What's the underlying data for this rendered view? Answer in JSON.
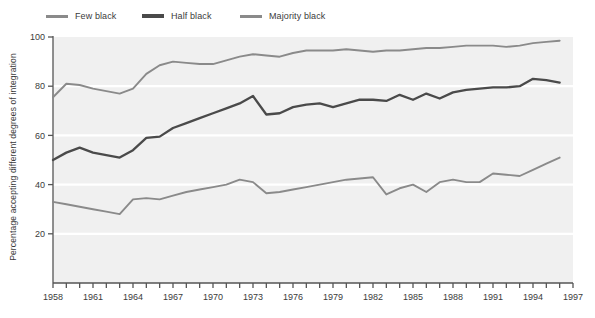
{
  "chart_data": {
    "type": "line",
    "title": "",
    "subtitle": "",
    "xlabel": "",
    "ylabel": "Percentage accepting different degrees of integration",
    "xlim": [
      1958,
      1997
    ],
    "ylim": [
      0,
      100
    ],
    "grid": true,
    "grid_orientation": "horizontal",
    "legend_position": "top-left",
    "ytick_labels": [
      "20",
      "40",
      "60",
      "80",
      "100"
    ],
    "ytick_values": [
      20,
      40,
      60,
      80,
      100
    ],
    "xtick_labels": [
      "1958",
      "1961",
      "1964",
      "1967",
      "1970",
      "1973",
      "1976",
      "1979",
      "1982",
      "1985",
      "1988",
      "1991",
      "1994",
      "1997"
    ],
    "xtick_values": [
      1958,
      1961,
      1964,
      1967,
      1970,
      1973,
      1976,
      1979,
      1982,
      1985,
      1988,
      1991,
      1994,
      1997
    ],
    "x": [
      1958,
      1959,
      1960,
      1961,
      1962,
      1963,
      1964,
      1965,
      1966,
      1967,
      1968,
      1969,
      1970,
      1971,
      1972,
      1973,
      1974,
      1975,
      1976,
      1977,
      1978,
      1979,
      1980,
      1981,
      1982,
      1983,
      1984,
      1985,
      1986,
      1987,
      1988,
      1989,
      1990,
      1991,
      1992,
      1993,
      1994,
      1995,
      1996
    ],
    "series": [
      {
        "name": "Few black",
        "color": "#8a8a8a",
        "values": [
          33,
          32,
          31,
          30,
          29,
          28,
          34,
          34.5,
          34,
          35.5,
          37,
          38,
          39,
          40,
          42,
          41,
          36.5,
          37,
          38,
          39,
          40,
          41,
          42,
          42.5,
          43,
          36,
          38.5,
          40,
          37,
          41,
          42,
          41,
          41,
          44.5,
          44,
          43.5,
          46,
          48.5,
          51
        ]
      },
      {
        "name": "Half black",
        "color": "#4a4a4a",
        "values": [
          50,
          53,
          55,
          53,
          52,
          51,
          54,
          59,
          59.5,
          63,
          65,
          67,
          69,
          71,
          73,
          76,
          68.5,
          69,
          71.5,
          72.5,
          73,
          71.5,
          73,
          74.5,
          74.5,
          74,
          76.5,
          74.5,
          77,
          75,
          77.5,
          78.5,
          79,
          79.5,
          79.5,
          80,
          83,
          82.5,
          81.5
        ]
      },
      {
        "name": "Majority black",
        "color": "#8a8a8a",
        "values": [
          75.5,
          81,
          80.5,
          79,
          78,
          77,
          79,
          85,
          88.5,
          90,
          89.5,
          89,
          89,
          90.5,
          92,
          93,
          92.5,
          92,
          93.5,
          94.5,
          94.5,
          94.5,
          95,
          94.5,
          94,
          94.5,
          94.5,
          95,
          95.5,
          95.5,
          96,
          96.5,
          96.5,
          96.5,
          96,
          96.5,
          97.5,
          98,
          98.5
        ]
      }
    ]
  },
  "legend": {
    "items": [
      {
        "label": "Few black",
        "swatch_color": "#8a8a8a",
        "icon": "line-swatch-icon"
      },
      {
        "label": "Half black",
        "swatch_color": "#4a4a4a",
        "icon": "line-swatch-icon"
      },
      {
        "label": "Majority black",
        "swatch_color": "#8a8a8a",
        "icon": "line-swatch-icon"
      }
    ]
  },
  "axes": {
    "y_title": "Percentage accepting different degrees of integration"
  },
  "colors": {
    "plot_background": "#f0f0f0",
    "gridline": "#ffffff",
    "axis": "#555555",
    "text": "#3b3b3b",
    "few_black": "#8a8a8a",
    "half_black": "#4a4a4a",
    "majority_black": "#8a8a8a"
  }
}
